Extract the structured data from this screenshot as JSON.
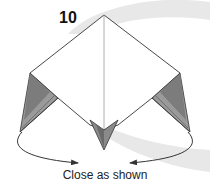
{
  "diagram": {
    "step_number": "10",
    "caption": "Close as shown",
    "colors": {
      "background": "#ffffff",
      "swoosh": "#e6e6e6",
      "outline": "#333333",
      "flap_dark": "#7a7a7a",
      "flap_mid": "#a8a8a8",
      "flap_light": "#c8c8c8",
      "arrow": "#333333",
      "center_line": "#999999"
    },
    "elements": [
      "background-swoosh",
      "square-model-top",
      "left-flap",
      "right-flap",
      "center-bottom-point",
      "left-arrow",
      "right-arrow"
    ]
  }
}
